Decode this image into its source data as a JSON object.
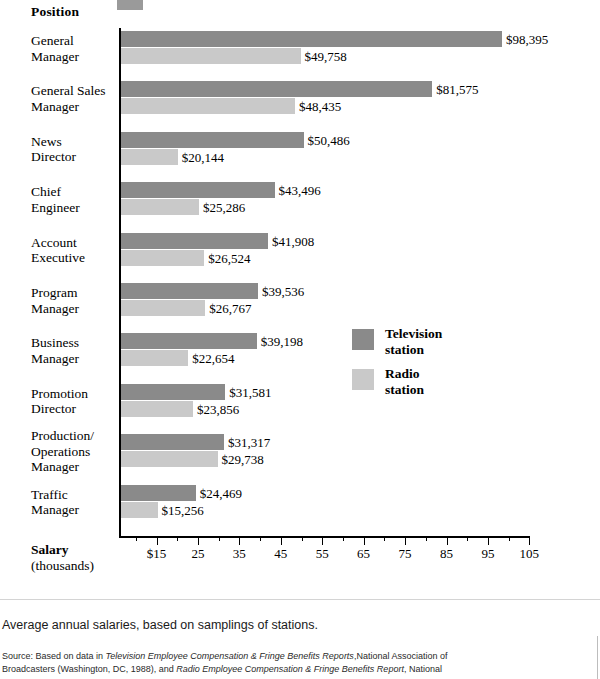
{
  "header": {
    "position_label": "Position"
  },
  "axis": {
    "title_bold": "Salary",
    "title_sub": "(thousands)",
    "tick_labels": [
      "$15",
      "25",
      "35",
      "45",
      "55",
      "65",
      "75",
      "85",
      "95",
      "105"
    ],
    "tick_values": [
      15,
      25,
      35,
      45,
      55,
      65,
      75,
      85,
      95,
      105
    ]
  },
  "legend": {
    "items": [
      {
        "label": "Television\nstation",
        "color": "#8a8a8a",
        "name": "television-station"
      },
      {
        "label": "Radio\nstation",
        "color": "#c9c9c9",
        "name": "radio-station"
      }
    ]
  },
  "footer": {
    "caption": "Average annual salaries, based on samplings of stations.",
    "source_prefix": "Source: Based on data in ",
    "source_italic_1": "Television Employee Compensation & Fringe Benefits Reports",
    "source_mid_1": ",National Association of Broadcasters (Washington, DC, 1988), and ",
    "source_italic_2": "Radio Employee Compensation & Fringe Benefits Report",
    "source_mid_2": ", National"
  },
  "chart_data": {
    "type": "bar",
    "orientation": "horizontal",
    "title": "",
    "xlabel": "Salary (thousands)",
    "ylabel": "Position",
    "xlim": [
      6.2,
      105
    ],
    "grid": false,
    "legend_position": "middle-right",
    "categories": [
      "General\nManager",
      "General Sales\nManager",
      "News\nDirector",
      "Chief\nEngineer",
      "Account\nExecutive",
      "Program\nManager",
      "Business\nManager",
      "Promotion\nDirector",
      "Production/\nOperations\nManager",
      "Traffic\nManager"
    ],
    "series": [
      {
        "name": "Television station",
        "color": "#8a8a8a",
        "values": [
          98395,
          81575,
          50486,
          43496,
          41908,
          39536,
          39198,
          31581,
          31317,
          24469
        ],
        "labels": [
          "$98,395",
          "$81,575",
          "$50,486",
          "$43,496",
          "$41,908",
          "$39,536",
          "$39,198",
          "$31,581",
          "$31,317",
          "$24,469"
        ]
      },
      {
        "name": "Radio station",
        "color": "#c9c9c9",
        "values": [
          49758,
          48435,
          20144,
          25286,
          26524,
          26767,
          22654,
          23856,
          29738,
          15256
        ],
        "labels": [
          "$49,758",
          "$48,435",
          "$20,144",
          "$25,286",
          "$26,524",
          "$26,767",
          "$22,654",
          "$23,856",
          "$29,738",
          "$15,256"
        ]
      }
    ]
  }
}
